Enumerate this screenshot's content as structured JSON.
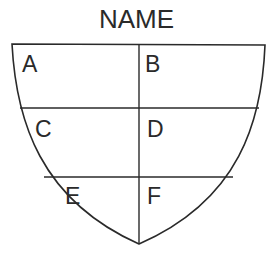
{
  "diagram": {
    "title": "NAME",
    "shape": "shield",
    "stroke_color": "#2a2a2a",
    "rows": 3,
    "columns": 2,
    "cells": [
      {
        "id": "A",
        "label": "A",
        "row": 0,
        "col": 0
      },
      {
        "id": "B",
        "label": "B",
        "row": 0,
        "col": 1
      },
      {
        "id": "C",
        "label": "C",
        "row": 1,
        "col": 0
      },
      {
        "id": "D",
        "label": "D",
        "row": 1,
        "col": 1
      },
      {
        "id": "E",
        "label": "E",
        "row": 2,
        "col": 0
      },
      {
        "id": "F",
        "label": "F",
        "row": 2,
        "col": 1
      }
    ]
  }
}
